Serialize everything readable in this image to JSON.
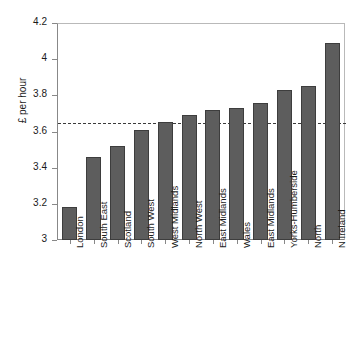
{
  "chart_data": {
    "type": "bar",
    "title": "",
    "subtitle": "",
    "xlabel": "",
    "ylabel": "£ per hour",
    "ylim": [
      3,
      4.2
    ],
    "ytick_labels": [
      "4.2",
      "4",
      "3.8",
      "3.6",
      "3.4",
      "3.2",
      "3"
    ],
    "ytick_values": [
      4.2,
      4.0,
      3.8,
      3.6,
      3.4,
      3.2,
      3.0
    ],
    "grid": false,
    "legend": false,
    "legend_position": "none",
    "bar_color": "#5d5d5d",
    "bar_edge_color": "#3d3d3d",
    "axis_color": "#888888",
    "reference_line": {
      "value": 3.65,
      "style": "dashed",
      "color": "#3a3a3a",
      "label": ""
    },
    "categories": [
      "London",
      "South East",
      "Scotland",
      "South West",
      "West Midlands",
      "North West",
      "East Midlands",
      "Wales",
      "East Midlands",
      "Yorks-Humberside",
      "North",
      "N Ireland"
    ],
    "values": [
      3.18,
      3.46,
      3.52,
      3.61,
      3.65,
      3.69,
      3.72,
      3.73,
      3.76,
      3.83,
      3.85,
      4.09
    ]
  }
}
